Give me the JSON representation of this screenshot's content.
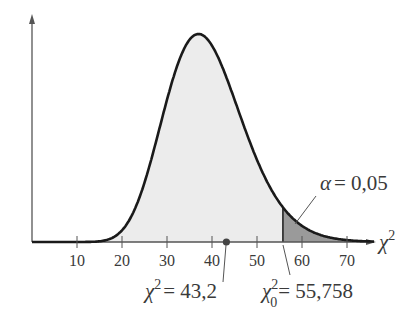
{
  "chart_data": {
    "type": "area",
    "title": "",
    "distribution": "chi-square",
    "degrees_of_freedom": 39,
    "xlabel": "χ²",
    "ylabel": "",
    "xlim": [
      0,
      76
    ],
    "x_ticks": [
      10,
      20,
      30,
      40,
      50,
      60,
      70
    ],
    "x_tick_labels": [
      "10",
      "20",
      "30",
      "40",
      "50",
      "60",
      "70"
    ],
    "critical_value": 55.758,
    "test_statistic": 43.2,
    "alpha": 0.05,
    "annotations": {
      "alpha_label": {
        "symbol": "α",
        "text": "= 0,05"
      },
      "test_stat_label": {
        "symbol": "χ",
        "sup": "2",
        "text": "= 43,2"
      },
      "critical_label": {
        "symbol": "χ",
        "sup": "2",
        "sub": "0",
        "text": "= 55,758"
      },
      "axis_label": {
        "symbol": "χ",
        "sup": "2"
      }
    },
    "colors": {
      "curve": "#1a1a1a",
      "acceptance_fill": "#ececec",
      "rejection_fill": "#9a9a9a",
      "axis": "#555555",
      "dot": "#444444"
    }
  }
}
